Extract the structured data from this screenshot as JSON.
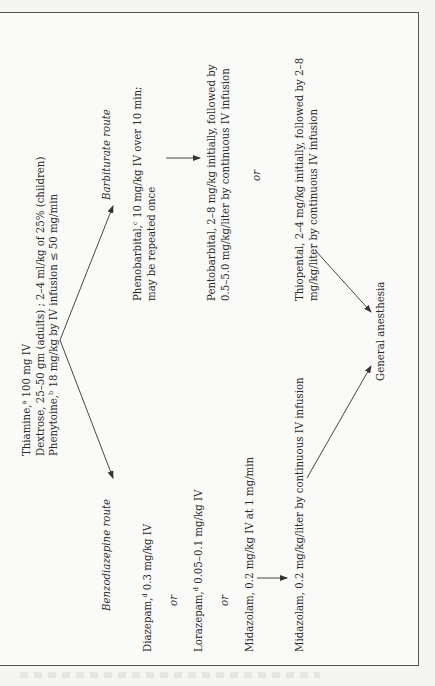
{
  "diagram": {
    "orientation": "rotated-90-ccw",
    "initial": {
      "lines": [
        {
          "drug": "Thiamine,",
          "sup": "a",
          "dose": " 100 mg IV"
        },
        {
          "drug": "Dextrose,",
          "sup": "",
          "dose": " 25–50 gm (adults) ; 2–4 ml/kg of 25% (children)"
        },
        {
          "drug": "Phenytoine,",
          "sup": "b",
          "dose": " 18 mg/kg by IV infusion ≤ 50 mg/min"
        }
      ]
    },
    "barbiturate_route": {
      "title": "Barbiturate route",
      "phenobarbital": {
        "drug": "Phenobarbital,",
        "sup": "c",
        "line1": " 10 mg/kg IV over 10 min;",
        "line2": "may be repeated once"
      },
      "pentobarbital": {
        "line1": "Pentobarbital, 2–8 mg/kg initially, followed by",
        "line2": "0.5–5.0 mg/kg/liter by continuous IV infusion"
      },
      "or_label": "or",
      "thiopental": {
        "line1": "Thiopental, 2–4 mg/kg initially, followed by 2–8",
        "line2": "mg/kg/liter by continuous IV infusion"
      }
    },
    "benzodiazepine_route": {
      "title": "Benzodiazepine route",
      "diazepam": {
        "drug": "Diazepam,",
        "sup": "d",
        "dose": " 0.3 mg/kg IV"
      },
      "or_label_1": "or",
      "lorazepam": {
        "drug": "Lorazepam,",
        "sup": "d",
        "dose": " 0.05–0.1 mg/kg IV"
      },
      "or_label_2": "or",
      "midazolam_bolus": "Midazolam, 0.2 mg/kg IV at 1 mg/min",
      "midazolam_infusion": "Midazolam, 0.2 mg/kg/liter by continuous IV infusion"
    },
    "outcome": "General anesthesia",
    "colors": {
      "line": "#333333",
      "text": "#2a2a2a",
      "background": "#fafaf8",
      "border": "#555555"
    }
  }
}
